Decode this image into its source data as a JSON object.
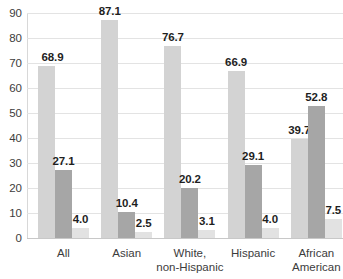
{
  "chart_data": {
    "type": "bar",
    "title": "",
    "subtitle": "",
    "xlabel": "",
    "ylabel": "",
    "ylim": [
      0,
      90
    ],
    "ytick_step": 10,
    "yticks": [
      "0",
      "10",
      "20",
      "30",
      "40",
      "50",
      "60",
      "70",
      "80",
      "90"
    ],
    "grid": true,
    "legend": "none",
    "categories": [
      "All",
      "Asian",
      "White,\nnon-Hispanic",
      "Hispanic",
      "African\nAmerican"
    ],
    "series": [
      {
        "name": "series-1",
        "color": "#d3d3d3",
        "values": [
          68.9,
          87.1,
          76.7,
          66.9,
          39.7
        ],
        "labels": [
          "68.9",
          "87.1",
          "76.7",
          "66.9",
          "39.7"
        ]
      },
      {
        "name": "series-2",
        "color": "#a6a6a6",
        "values": [
          27.1,
          10.4,
          20.2,
          29.1,
          52.8
        ],
        "labels": [
          "27.1",
          "10.4",
          "20.2",
          "29.1",
          "52.8"
        ]
      },
      {
        "name": "series-3",
        "color": "#e2e2e2",
        "values": [
          4.0,
          2.5,
          3.1,
          4.0,
          7.5
        ],
        "labels": [
          "4.0",
          "2.5",
          "3.1",
          "4.0",
          "7.5"
        ]
      }
    ],
    "colors": {
      "gridline": "#e3e3e3",
      "axis": "#c8c8c8",
      "tick_text": "#3c3c3c",
      "label_text": "#1f1f1f",
      "background": "#ffffff"
    }
  }
}
